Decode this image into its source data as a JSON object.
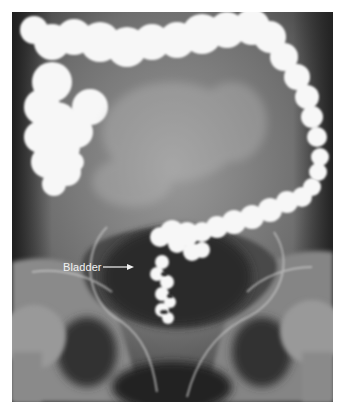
{
  "image": {
    "description": "Barium enema radiograph of the abdomen and pelvis showing contrast-filled colon and rectosigmoid",
    "annotations": [
      {
        "text": "Bladder",
        "pointer": "arrow-right"
      }
    ]
  },
  "colors": {
    "background": "#ffffff",
    "label_text": "#f2f2f2",
    "arrow": "#f2f2f2"
  }
}
